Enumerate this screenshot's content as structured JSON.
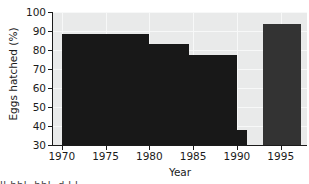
{
  "chart_data": {
    "type": "bar",
    "title": "",
    "xlabel": "Year",
    "ylabel": "Eggs hatched (%)",
    "xlim": [
      1969,
      1998
    ],
    "ylim": [
      30,
      100
    ],
    "grid": true,
    "legend": "none",
    "x_ticks": [
      1970,
      1975,
      1980,
      1985,
      1990,
      1995
    ],
    "x_tick_labels": [
      "1970",
      "1975",
      "1980",
      "1985",
      "1990",
      "1995"
    ],
    "y_ticks": [
      30,
      40,
      50,
      60,
      70,
      80,
      90,
      100
    ],
    "y_tick_labels": [
      "30",
      "40",
      "50",
      "60",
      "70",
      "80",
      "90",
      "100"
    ],
    "bar_color": "#181818",
    "highlight_bar_color": "#333333",
    "plot_background": "#e9eaea",
    "gridline_color": "#f7f8f8",
    "axis_color": "#1b1b1b",
    "bars": [
      {
        "label": "1970-1975",
        "x_start": 1970.0,
        "x_end": 1975.0,
        "value": 88.5,
        "color": "#181818"
      },
      {
        "label": "1975-1980",
        "x_start": 1975.0,
        "x_end": 1980.0,
        "value": 88.3,
        "color": "#181818"
      },
      {
        "label": "1980-1984.5",
        "x_start": 1980.0,
        "x_end": 1984.5,
        "value": 83.0,
        "color": "#181818"
      },
      {
        "label": "1984.5-1990",
        "x_start": 1984.5,
        "x_end": 1990.0,
        "value": 77.3,
        "color": "#181818"
      },
      {
        "label": "1990-1991",
        "x_start": 1990.0,
        "x_end": 1991.1,
        "value": 38.0,
        "color": "#181818"
      },
      {
        "label": "1993-1997",
        "x_start": 1993.0,
        "x_end": 1997.3,
        "value": 93.8,
        "color": "#333333"
      }
    ],
    "categories": [
      "1970-1975",
      "1975-1980",
      "1980-1984.5",
      "1984.5-1990",
      "1990-1991",
      "1993-1997"
    ],
    "values": [
      88.5,
      88.3,
      83.0,
      77.3,
      38.0,
      93.8
    ]
  },
  "caption_sliver": "ll-bbl. bbl.   d.l.l.     .     .   ."
}
